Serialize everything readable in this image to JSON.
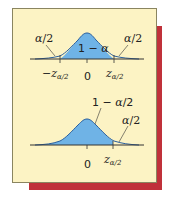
{
  "figure": {
    "top_diagram": {
      "description": "Two-tailed normal distribution",
      "center_label": "1−α",
      "left_tail_label": "α/2",
      "right_tail_label": "α/2",
      "axis_ticks": [
        "−z",
        "0",
        "z"
      ],
      "tick_subscript": "α/2",
      "left_tick": "−z",
      "center_tick": "0",
      "right_tick": "z"
    },
    "bottom_diagram": {
      "description": "One-tailed normal distribution",
      "shaded_label": "1−α/2",
      "right_tail_label": "α/2",
      "center_tick": "0",
      "right_tick": "z",
      "tick_subscript": "α/2"
    },
    "colors": {
      "fill": "#6fb3e6",
      "curve": "#2a5f9e",
      "panel": "#fcf3c4",
      "shadow": "#c0313a"
    }
  }
}
